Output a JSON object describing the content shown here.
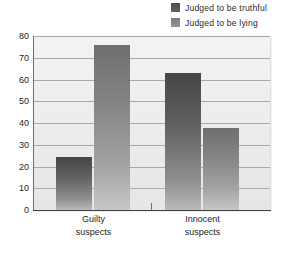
{
  "chart_data": {
    "type": "bar",
    "title": "",
    "subtitle": "",
    "xlabel": "",
    "ylabel": "",
    "ylim": [
      0,
      80
    ],
    "yticks": [
      0,
      10,
      20,
      30,
      40,
      50,
      60,
      70,
      80
    ],
    "grid": true,
    "legend_position": "top-right",
    "categories": [
      "Guilty suspects",
      "Innocent suspects"
    ],
    "category_lines": [
      [
        "Guilty",
        "suspects"
      ],
      [
        "Innocent",
        "suspects"
      ]
    ],
    "series": [
      {
        "name": "Judged to be truthful",
        "color": "#4a4a4a",
        "values": [
          24.5,
          63
        ]
      },
      {
        "name": "Judged to be lying",
        "color": "#8a8a8a",
        "values": [
          76,
          37.5
        ]
      }
    ]
  },
  "legend": {
    "items": [
      {
        "label": "Judged to be truthful",
        "swatch": "truthful-swatch"
      },
      {
        "label": "Judged to be lying",
        "swatch": "lying-swatch"
      }
    ]
  },
  "axes": {
    "y": {
      "ticks": [
        "80",
        "70",
        "60",
        "50",
        "40",
        "30",
        "20",
        "10",
        "0"
      ]
    },
    "x": {
      "groups": [
        {
          "line1": "Guilty",
          "line2": "suspects"
        },
        {
          "line1": "Innocent",
          "line2": "suspects"
        }
      ]
    }
  },
  "colors": {
    "plot_background": "#eeeeee",
    "gridline": "#a9a9a9",
    "axis": "#3f3f3f",
    "bar_truthful": "#4a4a4a",
    "bar_lying": "#8a8a8a",
    "text": "#231f20"
  }
}
